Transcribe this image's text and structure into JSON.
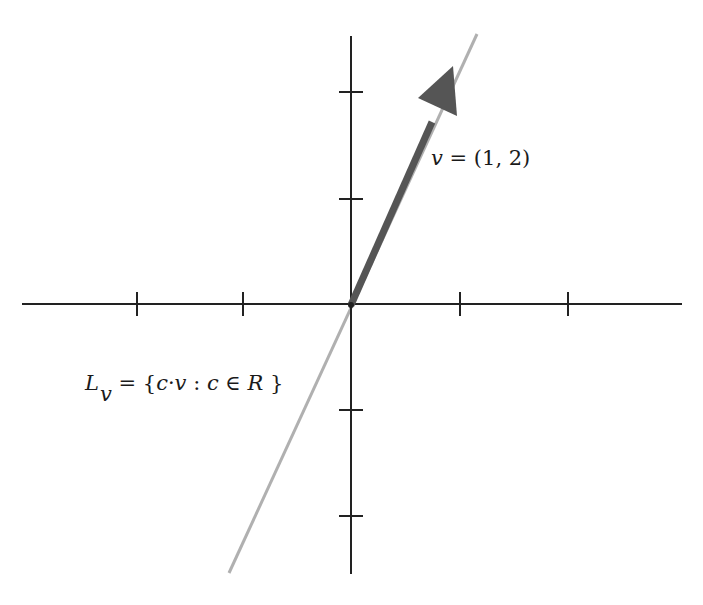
{
  "diagram": {
    "type": "coordinate-plane-vector-span",
    "origin_px": [
      351,
      305
    ],
    "unit_px": 107,
    "x_axis": {
      "from_px": 22,
      "to_px": 682,
      "ticks": [
        -2,
        -1,
        1,
        2
      ]
    },
    "y_axis": {
      "from_px": 36,
      "to_px": 574,
      "ticks": [
        -2,
        -1,
        1,
        2
      ]
    },
    "vector": {
      "components": [
        1,
        2
      ],
      "color": "#555555"
    },
    "span_line": {
      "color": "#b0b0b0",
      "from": [
        -1.14,
        -2.5
      ],
      "to": [
        1.17,
        2.53
      ]
    },
    "labels": {
      "vector_var": "v",
      "vector_eq": " = (1, 2)",
      "line_main": "L",
      "line_sub": "v",
      "line_eq": " = {",
      "line_c1": "c",
      "line_dot": "·",
      "line_v": "v",
      "line_colon": " : ",
      "line_c2": "c",
      "line_in": " ∈ ",
      "line_R": "R",
      "line_close": " }"
    }
  }
}
